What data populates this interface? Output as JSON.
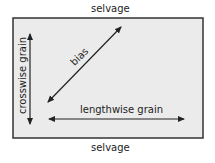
{
  "diagram": {
    "top_label": "selvage",
    "bottom_label": "selvage",
    "crosswise_label": "crosswise grain",
    "bias_label": "bias",
    "lengthwise_label": "lengthwise grain",
    "colors": {
      "fabric_fill": "#ebebeb",
      "stroke": "#222222"
    }
  }
}
